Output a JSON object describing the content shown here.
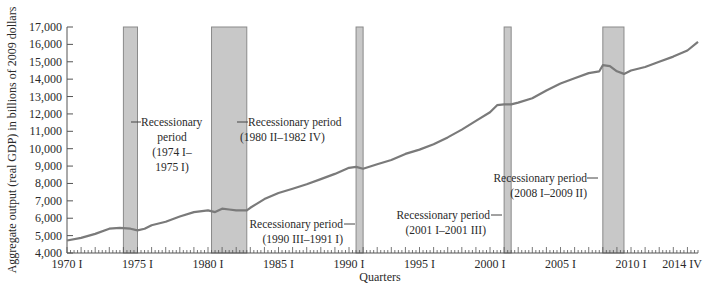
{
  "chart_data": {
    "type": "line",
    "title": "",
    "xlabel": "Quarters",
    "ylabel": "Aggregate output (real GDP) in billions of 2009 dollars",
    "ylim": [
      4000,
      17000
    ],
    "xlim": [
      "1970 I",
      "2014 IV"
    ],
    "grid": false,
    "legend": "none",
    "y_ticks": [
      "4,000",
      "5,000",
      "6,000",
      "7,000",
      "8,000",
      "9,000",
      "10,000",
      "11,000",
      "12,000",
      "13,000",
      "14,000",
      "15,000",
      "16,000",
      "17,000"
    ],
    "x_ticks": [
      "1970 I",
      "1975 I",
      "1980 I",
      "1985 I",
      "1990 I",
      "1995 I",
      "2000 I",
      "2005 I",
      "2010 I",
      "2014 IV"
    ],
    "series": [
      {
        "name": "Real GDP",
        "color": "#7a7a7a",
        "x": [
          1970.0,
          1971.0,
          1972.0,
          1973.0,
          1973.75,
          1974.5,
          1975.0,
          1975.5,
          1976.0,
          1977.0,
          1978.0,
          1979.0,
          1980.0,
          1980.5,
          1981.0,
          1981.5,
          1982.0,
          1982.75,
          1983.0,
          1984.0,
          1985.0,
          1986.0,
          1987.0,
          1988.0,
          1989.0,
          1990.0,
          1990.5,
          1991.0,
          1992.0,
          1993.0,
          1994.0,
          1995.0,
          1996.0,
          1997.0,
          1998.0,
          1999.0,
          2000.0,
          2000.5,
          2001.0,
          2001.5,
          2002.0,
          2003.0,
          2004.0,
          2005.0,
          2006.0,
          2007.0,
          2007.75,
          2008.0,
          2008.5,
          2009.0,
          2009.5,
          2010.0,
          2011.0,
          2012.0,
          2013.0,
          2014.0,
          2014.75
        ],
        "values": [
          4720,
          4870,
          5100,
          5400,
          5450,
          5400,
          5300,
          5400,
          5600,
          5800,
          6100,
          6350,
          6450,
          6350,
          6550,
          6500,
          6450,
          6450,
          6600,
          7100,
          7450,
          7700,
          7950,
          8250,
          8550,
          8900,
          8950,
          8850,
          9100,
          9350,
          9700,
          9950,
          10250,
          10650,
          11100,
          11600,
          12100,
          12500,
          12550,
          12550,
          12650,
          12900,
          13350,
          13750,
          14050,
          14350,
          14450,
          14800,
          14750,
          14450,
          14300,
          14500,
          14700,
          15000,
          15300,
          15650,
          16150
        ]
      }
    ],
    "shaded_regions": [
      {
        "label": "Recessionary period (1974 I–1975 I)",
        "start": 1974.0,
        "end": 1975.0,
        "color": "#c8c8c8"
      },
      {
        "label": "Recessionary period (1980 II–1982 IV)",
        "start": 1980.25,
        "end": 1982.75,
        "color": "#c8c8c8"
      },
      {
        "label": "Recessionary period (1990 III–1991 I)",
        "start": 1990.5,
        "end": 1991.0,
        "color": "#c8c8c8"
      },
      {
        "label": "Recessionary period (2001 I–2001 III)",
        "start": 2001.0,
        "end": 2001.5,
        "color": "#c8c8c8"
      },
      {
        "label": "Recessionary period (2008 I–2009 II)",
        "start": 2008.0,
        "end": 2009.5,
        "color": "#c8c8c8"
      }
    ]
  },
  "annotations": [
    {
      "lines": [
        "Recessionary",
        "period",
        "(1974 I–",
        "1975 I)"
      ]
    },
    {
      "lines": [
        "Recessionary period",
        "(1980 II–1982 IV)"
      ]
    },
    {
      "lines": [
        "Recessionary period",
        "(1990 III–1991 I)"
      ]
    },
    {
      "lines": [
        "Recessionary period",
        "(2001 I–2001 III)"
      ]
    },
    {
      "lines": [
        "Recessionary period",
        "(2008 I–2009 II)"
      ]
    }
  ]
}
